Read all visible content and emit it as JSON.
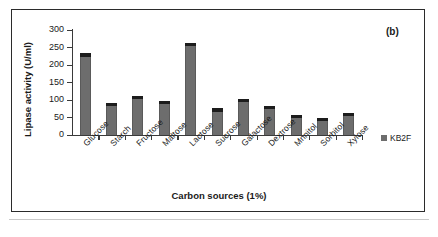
{
  "panel_label": "(b)",
  "legend": {
    "entries": [
      {
        "label": "KB2F",
        "color": "#6d6d6d"
      }
    ]
  },
  "chart_data": {
    "type": "bar",
    "title": "",
    "subtitle": "",
    "panel": "(b)",
    "xlabel": "Carbon sources (1%)",
    "ylabel": "Lipase activity (U/ml)",
    "categories": [
      "Glucose",
      "Starch",
      "Fructose",
      "Maltose",
      "Lactose",
      "Sucrose",
      "Galactose",
      "Dextrose",
      "Mnnitol",
      "Sorbitol",
      "Xylose"
    ],
    "series": [
      {
        "name": "KB2F",
        "color": "#6d6d6d",
        "values": [
          226,
          85,
          105,
          92,
          256,
          70,
          96,
          76,
          52,
          42,
          56
        ],
        "errors": [
          5,
          3,
          4,
          3,
          5,
          3,
          3,
          3,
          3,
          3,
          3
        ]
      }
    ],
    "ylim": [
      0,
      300
    ],
    "ytick_values": [
      0,
      50,
      100,
      150,
      200,
      250,
      300
    ],
    "ytick_labels": [
      "0",
      "50",
      "100",
      "150",
      "200",
      "250",
      "300"
    ],
    "grid": false,
    "legend_position": "right",
    "error_bars": true,
    "bar_color": "#6d6d6d",
    "axis_color": "#3a3a3a"
  }
}
